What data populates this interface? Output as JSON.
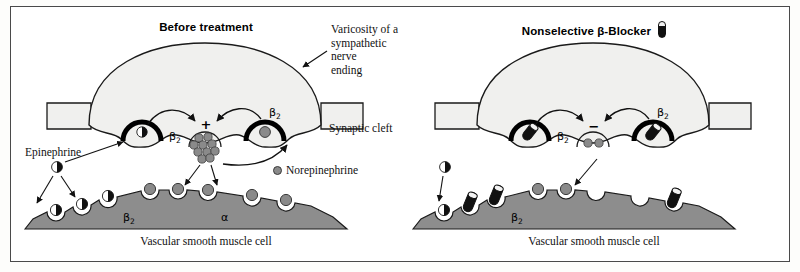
{
  "figure": {
    "background": "#ffffff",
    "border_color": "#4a4a4a",
    "colors": {
      "nerve_fill": "#f0f0ee",
      "muscle_fill": "#8d8d8d",
      "norepinephrine": "#8a8a8a",
      "epinephrine_dark": "#111111",
      "receptor_outline": "#000000",
      "blocker_body": "#111111",
      "blocker_cap": "#f2f2f2"
    }
  },
  "panels": [
    {
      "id": "before-treatment",
      "title": "Before treatment",
      "has_capsule_icon": false,
      "annotations": {
        "varicosity": "Varicosity of a\nsympathetic nerve\nending",
        "synaptic_cleft": "Synaptic cleft",
        "epinephrine": "Epinephrine",
        "muscle_cell": "Vascular smooth muscle cell"
      },
      "legend": {
        "norepinephrine": "Norepinephrine"
      },
      "receptor_labels": {
        "presyn_left": "β",
        "presyn_left_sub": "2",
        "presyn_right": "β",
        "presyn_right_sub": "2",
        "muscle_left": "β",
        "muscle_left_sub": "2",
        "muscle_right": "α"
      },
      "modulation_sign": "+",
      "vesicle_count": 10,
      "presynaptic_receptors": [
        {
          "x": 131,
          "y": 124,
          "occupant": "epinephrine"
        },
        {
          "x": 254,
          "y": 124,
          "occupant": "norepinephrine"
        }
      ],
      "muscle_receptors": [
        {
          "x": 70,
          "y": 205,
          "occupant": "epinephrine"
        },
        {
          "x": 96,
          "y": 198,
          "occupant": "epinephrine"
        },
        {
          "x": 124,
          "y": 191,
          "occupant": "epinephrine"
        },
        {
          "x": 175,
          "y": 184,
          "occupant": "norepinephrine"
        },
        {
          "x": 205,
          "y": 184,
          "occupant": "norepinephrine"
        },
        {
          "x": 232,
          "y": 186,
          "occupant": "norepinephrine"
        },
        {
          "x": 277,
          "y": 191,
          "occupant": "norepinephrine"
        },
        {
          "x": 310,
          "y": 197,
          "occupant": "norepinephrine"
        }
      ],
      "free_molecules": [
        {
          "x": 46,
          "y": 160,
          "type": "epinephrine"
        }
      ]
    },
    {
      "id": "nonselective-beta-blocker",
      "title": "Nonselective β-Blocker",
      "has_capsule_icon": true,
      "annotations": {
        "muscle_cell": "Vascular smooth muscle cell"
      },
      "receptor_labels": {
        "presyn_left": "β",
        "presyn_left_sub": "2",
        "presyn_right": "β",
        "presyn_right_sub": "2",
        "muscle_left": "β",
        "muscle_left_sub": "2"
      },
      "modulation_sign": "−",
      "vesicle_count": 2,
      "presynaptic_receptors": [
        {
          "x": 131,
          "y": 124,
          "occupant": "blocker"
        },
        {
          "x": 254,
          "y": 124,
          "occupant": "blocker"
        }
      ],
      "muscle_receptors": [
        {
          "x": 70,
          "y": 205,
          "occupant": "epinephrine"
        },
        {
          "x": 96,
          "y": 198,
          "occupant": "blocker"
        },
        {
          "x": 124,
          "y": 191,
          "occupant": "blocker"
        },
        {
          "x": 175,
          "y": 184,
          "occupant": "norepinephrine"
        },
        {
          "x": 205,
          "y": 184,
          "occupant": "norepinephrine"
        },
        {
          "x": 232,
          "y": 186,
          "occupant": "empty"
        },
        {
          "x": 277,
          "y": 191,
          "occupant": "blocker"
        },
        {
          "x": 310,
          "y": 197,
          "occupant": "empty"
        }
      ],
      "free_molecules": [
        {
          "x": 46,
          "y": 160,
          "type": "epinephrine"
        }
      ]
    }
  ]
}
